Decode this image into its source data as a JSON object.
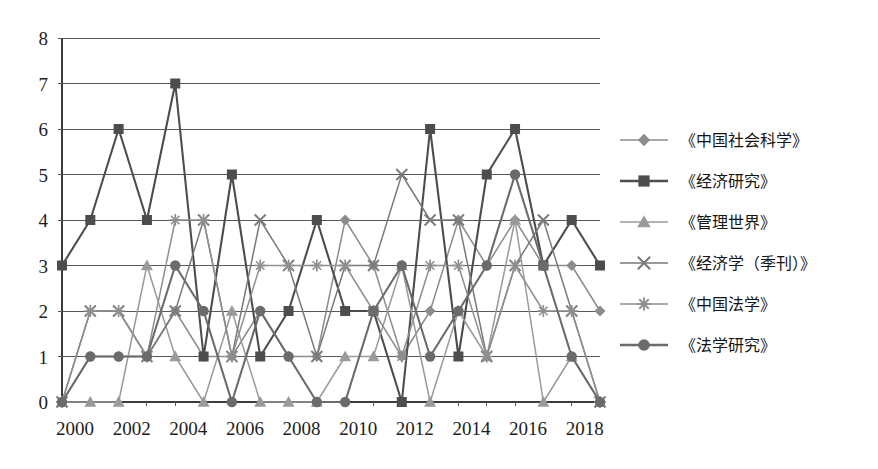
{
  "chart_data": {
    "type": "line",
    "title": "",
    "xlabel": "",
    "ylabel": "",
    "ylim": [
      0,
      8
    ],
    "yticks": [
      0,
      1,
      2,
      3,
      4,
      5,
      6,
      7,
      8
    ],
    "ytick_labels": [
      "0",
      "1",
      "2",
      "3",
      "4",
      "5",
      "6",
      "7",
      "8"
    ],
    "grid": true,
    "legend_position": "right",
    "x": [
      2000,
      2001,
      2002,
      2003,
      2004,
      2005,
      2006,
      2007,
      2008,
      2009,
      2010,
      2011,
      2012,
      2013,
      2014,
      2015,
      2016,
      2017,
      2018,
      2019
    ],
    "xtick_values": [
      2000,
      2002,
      2004,
      2006,
      2008,
      2010,
      2012,
      2014,
      2016,
      2018
    ],
    "xtick_labels": [
      "2000",
      "2002",
      "2004",
      "2006",
      "2008",
      "2010",
      "2012",
      "2014",
      "2016",
      "2018"
    ],
    "series": [
      {
        "name": "《中国社会科学》",
        "marker": "diamond",
        "color": "#8c8c8c",
        "values": [
          0,
          1,
          1,
          1,
          2,
          1,
          1,
          2,
          1,
          1,
          4,
          3,
          1,
          2,
          4,
          3,
          4,
          3,
          3,
          2
        ]
      },
      {
        "name": "《经济研究》",
        "marker": "square",
        "color": "#4d4d4d",
        "values": [
          3,
          4,
          6,
          4,
          7,
          1,
          5,
          1,
          2,
          4,
          2,
          2,
          0,
          6,
          1,
          5,
          6,
          3,
          4,
          3
        ]
      },
      {
        "name": "《管理世界》",
        "marker": "triangle",
        "color": "#9a9a9a",
        "values": [
          0,
          0,
          0,
          3,
          1,
          0,
          2,
          0,
          0,
          0,
          1,
          1,
          3,
          0,
          2,
          1,
          4,
          0,
          1,
          0
        ]
      },
      {
        "name": "《经济学（季刊）》",
        "marker": "x",
        "color": "#7a7a7a",
        "values": [
          0,
          2,
          2,
          1,
          2,
          4,
          1,
          4,
          3,
          1,
          3,
          3,
          5,
          4,
          4,
          1,
          3,
          4,
          2,
          0
        ]
      },
      {
        "name": "《中国法学》",
        "marker": "asterisk",
        "color": "#8f8f8f",
        "values": [
          0,
          2,
          2,
          1,
          4,
          4,
          1,
          3,
          3,
          3,
          3,
          2,
          1,
          3,
          3,
          1,
          3,
          2,
          2,
          0
        ]
      },
      {
        "name": "《法学研究》",
        "marker": "circle",
        "color": "#6b6b6b",
        "values": [
          0,
          1,
          1,
          1,
          3,
          2,
          0,
          2,
          1,
          0,
          0,
          2,
          3,
          1,
          2,
          3,
          5,
          3,
          1,
          0
        ]
      }
    ]
  },
  "legend": {
    "entries": [
      {
        "label": "《中国社会科学》"
      },
      {
        "label": "《经济研究》"
      },
      {
        "label": "《管理世界》"
      },
      {
        "label": "《经济学（季刊）》"
      },
      {
        "label": "《中国法学》"
      },
      {
        "label": "《法学研究》"
      }
    ]
  },
  "colors": {
    "background": "#ffffff",
    "grid": "#55595c",
    "axis": "#3a3d40",
    "text": "#1d1d1d"
  }
}
